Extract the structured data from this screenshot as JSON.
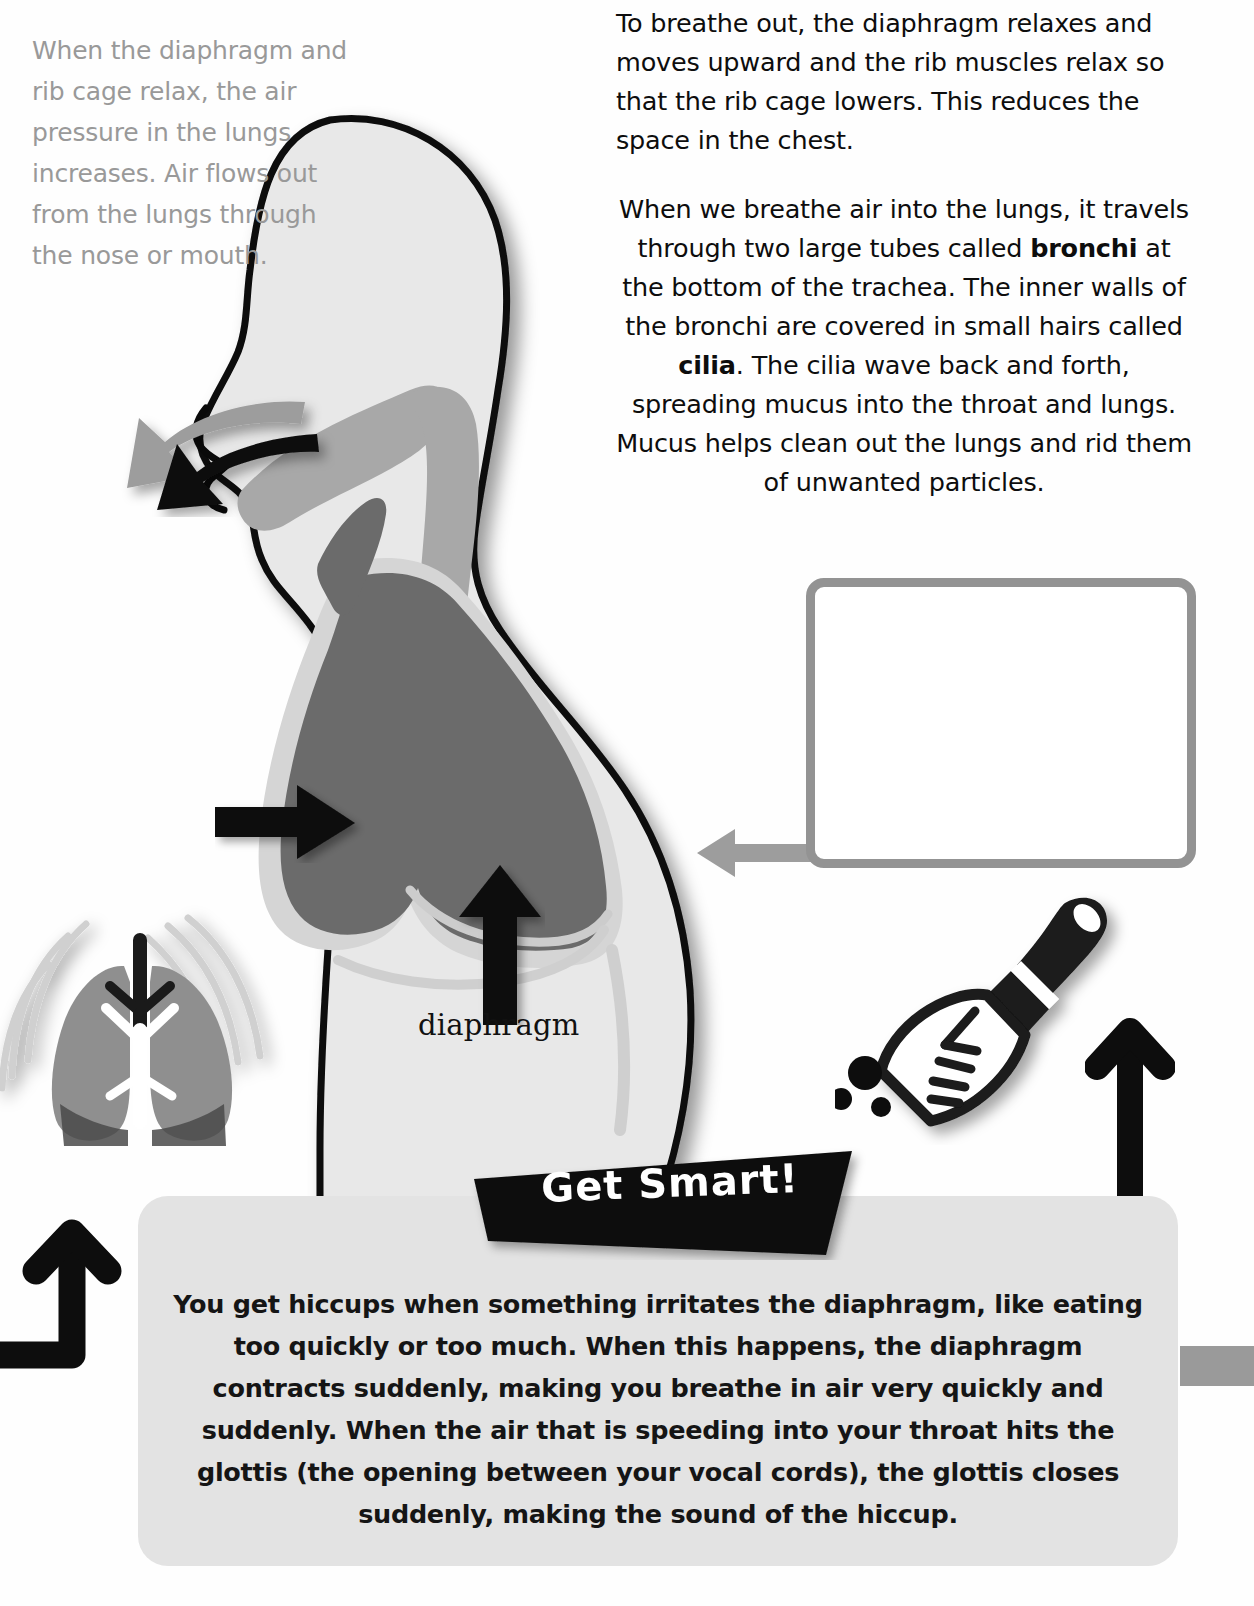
{
  "page": {
    "background_color": "#ffffff",
    "accent_gray": "#939393",
    "lung_color": "#6b6b6b",
    "body_color": "#e8e8e8",
    "factbox_color": "#e3e3e3"
  },
  "body_text": {
    "paragraph_1": "To breathe out, the diaphragm relaxes and moves upward and the rib muscles relax so that the rib cage lowers. This reduces the space in the chest.",
    "paragraph_2_part_1": "When we breathe air into the lungs, it travels through two large tubes called ",
    "paragraph_2_bold_1": "bronchi",
    "paragraph_2_part_2": " at the bottom of the trachea. The inner walls of the bronchi are covered in small hairs called ",
    "paragraph_2_bold_2": "cilia",
    "paragraph_2_part_3": ". The cilia wave back and forth, spreading mucus into the throat and lungs. Mucus helps clean out the lungs and rid them of unwanted particles."
  },
  "callout": {
    "text": "When the diaphragm and rib cage relax, the air pressure in the lungs increases. Air flows out from the lungs through the nose or mouth.",
    "border_color": "#939393",
    "text_color": "#999999"
  },
  "diagram": {
    "diaphragm_label": "diaphragm",
    "arrows": {
      "chest_arrow": "arrow-right-into-chest",
      "diaphragm_arrow": "arrow-up-diaphragm",
      "mouth_arrow_black": "arrow-curved-out-mouth-black",
      "mouth_arrow_gray": "arrow-curved-out-nose-gray",
      "callout_arrow": "arrow-left-gray",
      "page_arrow_right": "arrow-up-black",
      "page_arrow_elbow": "arrow-elbow-up-black"
    }
  },
  "banner": {
    "label": "Get Smart!"
  },
  "factbox": {
    "text": "You get hiccups when something irritates the diaphragm, like eating too quickly or too much. When this happens, the diaphragm contracts suddenly, making you breathe in air very quickly and suddenly. When the air that is speeding into your throat hits the glottis (the opening between your vocal cords), the glottis closes suddenly, making the sound of the hiccup."
  }
}
